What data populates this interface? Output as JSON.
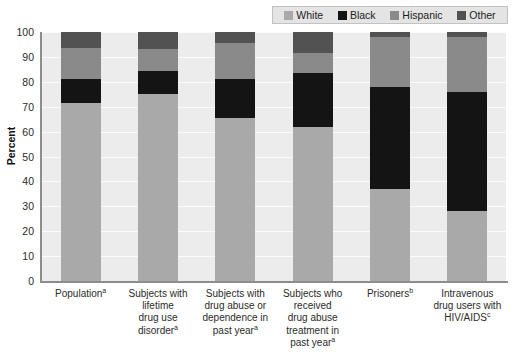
{
  "chart_data": {
    "type": "bar",
    "subtype": "stacked-bar-100",
    "title": "",
    "xlabel": "",
    "ylabel": "Percent",
    "ylim": [
      0,
      100
    ],
    "yticks": [
      0,
      10,
      20,
      30,
      40,
      50,
      60,
      70,
      80,
      90,
      100
    ],
    "grid": true,
    "legend_position": "top-right",
    "categories": [
      "Population",
      "Subjects with lifetime drug use disorder",
      "Subjects with drug abuse or dependence in past year",
      "Subjects who received drug abuse treatment in past year",
      "Prisoners",
      "Intravenous drug users with HIV/AIDS"
    ],
    "category_lines": [
      [
        "Population"
      ],
      [
        "Subjects with",
        "lifetime",
        "drug use",
        "disorder"
      ],
      [
        "Subjects with",
        "drug abuse or",
        "dependence in",
        "past year"
      ],
      [
        "Subjects who",
        "received",
        "drug abuse",
        "treatment in",
        "past year"
      ],
      [
        "Prisoners"
      ],
      [
        "Intravenous",
        "drug users with",
        "HIV/AIDS"
      ]
    ],
    "category_footnotes": [
      "a",
      "a",
      "a",
      "a",
      "b",
      "c"
    ],
    "series": [
      {
        "name": "White",
        "color": "#a9a9a9",
        "values": [
          71.5,
          75.0,
          65.5,
          62.0,
          37.0,
          28.0
        ]
      },
      {
        "name": "Black",
        "color": "#141414",
        "values": [
          9.5,
          9.5,
          15.5,
          21.5,
          41.0,
          48.0
        ]
      },
      {
        "name": "Hispanic",
        "color": "#8a8a8a",
        "values": [
          12.5,
          8.5,
          14.5,
          8.0,
          20.0,
          22.0
        ]
      },
      {
        "name": "Other",
        "color": "#525252",
        "values": [
          6.5,
          7.0,
          4.5,
          8.5,
          2.0,
          2.0
        ]
      }
    ]
  },
  "legend": {
    "items": [
      {
        "label": "White",
        "color": "#a9a9a9"
      },
      {
        "label": "Black",
        "color": "#141414"
      },
      {
        "label": "Hispanic",
        "color": "#8a8a8a"
      },
      {
        "label": "Other",
        "color": "#525252"
      }
    ]
  },
  "axes": {
    "y_title": "Percent",
    "y_tick_labels": [
      "100",
      "90",
      "80",
      "70",
      "60",
      "50",
      "40",
      "30",
      "20",
      "10",
      "0"
    ]
  }
}
